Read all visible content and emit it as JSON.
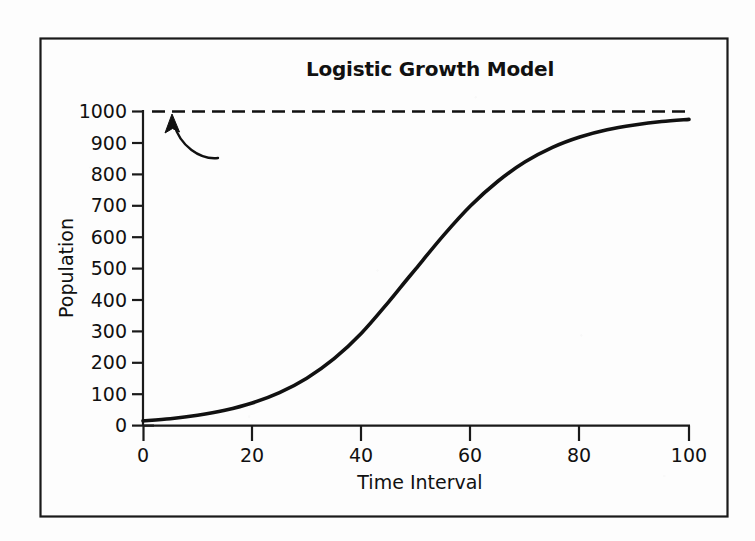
{
  "figure": {
    "title": "Logistic Growth Model",
    "frame": "outer-border"
  },
  "chart_data": {
    "type": "line",
    "title": "Logistic Growth Model",
    "xlabel": "Time Interval",
    "ylabel": "Population",
    "xlim": [
      0,
      100
    ],
    "ylim": [
      0,
      1000
    ],
    "xticks": [
      "0",
      "20",
      "40",
      "60",
      "80",
      "100"
    ],
    "yticks": [
      "0",
      "100",
      "200",
      "300",
      "400",
      "500",
      "600",
      "700",
      "800",
      "900",
      "1000"
    ],
    "grid": false,
    "legend": null,
    "series": [
      {
        "name": "Logistic growth curve",
        "style": "solid",
        "color": "#111111",
        "x": [
          0,
          5,
          10,
          15,
          20,
          25,
          30,
          35,
          40,
          45,
          48,
          50,
          55,
          60,
          65,
          70,
          75,
          80,
          85,
          90,
          95,
          100
        ],
        "values": [
          15,
          22,
          33,
          49,
          72,
          105,
          151,
          213,
          294,
          394,
          458,
          500,
          605,
          700,
          778,
          840,
          886,
          919,
          942,
          957,
          968,
          975
        ]
      },
      {
        "name": "Carrying capacity asymptote",
        "style": "dashed",
        "color": "#111111",
        "x": [
          0,
          100
        ],
        "values": [
          1000,
          1000
        ]
      }
    ],
    "annotations": [
      {
        "name": "asymptote-arrow",
        "type": "curved-arrow",
        "points_to_x": 5,
        "points_to_y": 1000,
        "text": ""
      }
    ]
  }
}
